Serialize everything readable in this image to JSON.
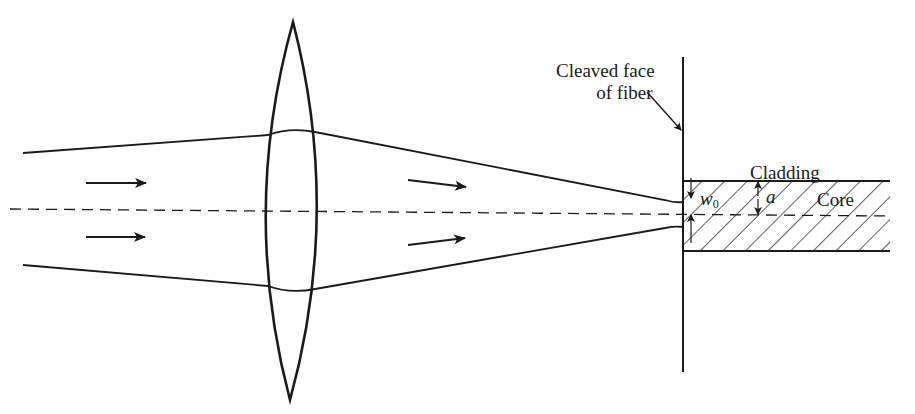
{
  "diagram": {
    "labels": {
      "cleaved_line1": "Cleaved face",
      "cleaved_line2": "of fiber",
      "cladding": "Cladding",
      "core": "Core",
      "w0_symbol": "w",
      "w0_subscript": "0",
      "a_symbol": "a"
    },
    "elements": {
      "lens": "biconvex-lens",
      "optical_axis": "dashed-line",
      "beam_arrows_count": 4,
      "fiber_face": "vertical-line",
      "fiber": "hatched-core"
    },
    "colors": {
      "stroke": "#1a1a1a",
      "background": "#ffffff"
    }
  }
}
